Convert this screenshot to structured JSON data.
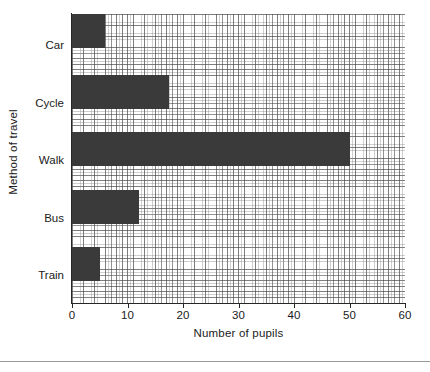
{
  "chart_data": {
    "type": "bar",
    "orientation": "horizontal",
    "title": "",
    "xlabel": "Number of pupils",
    "ylabel": "Method of travel",
    "categories": [
      "Car",
      "Cycle",
      "Walk",
      "Bus",
      "Train"
    ],
    "values": [
      6,
      17.5,
      50,
      12,
      5
    ],
    "xlim": [
      0,
      60
    ],
    "xticks": [
      0,
      10,
      20,
      30,
      40,
      50,
      60
    ],
    "xtick_labels": [
      "0",
      "10",
      "20",
      "30",
      "40",
      "50",
      "60"
    ],
    "grid": true,
    "grid_minor": true,
    "grid_minor_step": 0.5,
    "grid_major_step": 1,
    "legend": false,
    "bar_color": "#3a3a3a",
    "axis_color": "#262626",
    "grid_major_color": "#3c3c3c",
    "grid_minor_color": "#828282",
    "background": "#ffffff"
  },
  "figure": {
    "bottom_rule_color": "#9a9a9a"
  }
}
